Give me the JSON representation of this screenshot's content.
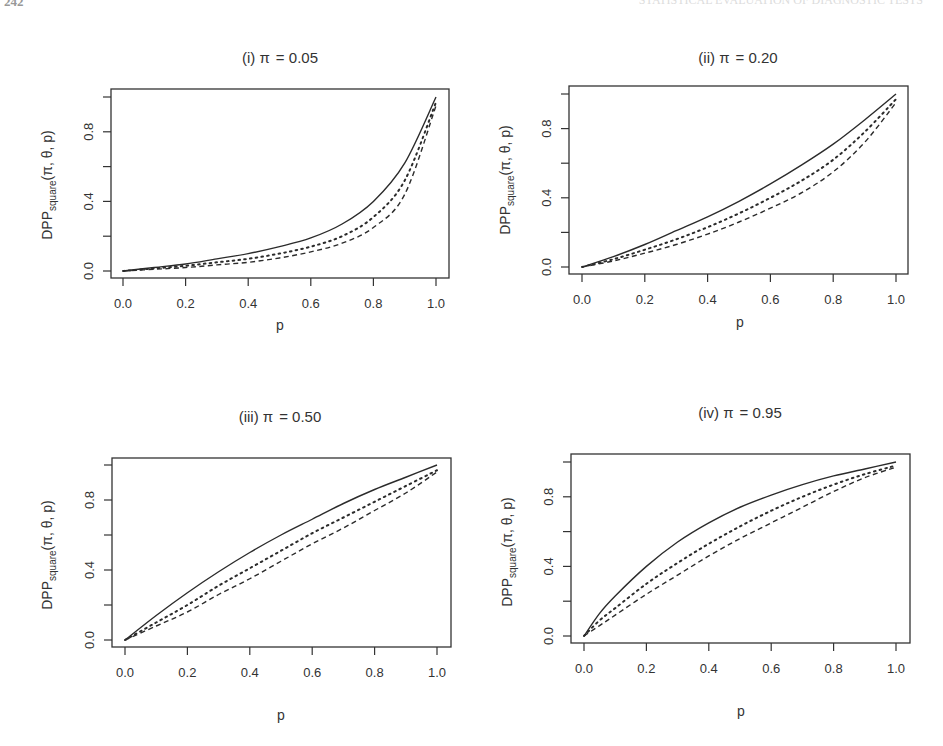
{
  "page": {
    "page_number": "242",
    "running_head": "STATISTICAL EVALUATION OF DIAGNOSTIC TESTS"
  },
  "chart_data": [
    {
      "type": "line",
      "panel": "i",
      "title": "(i) π = 0.05",
      "title_prefix": "(i) π",
      "title_value": "= 0.05",
      "pi": 0.05,
      "xlabel": "p",
      "ylabel": "DPP_square(π, θ, p)",
      "xlim": [
        0,
        1
      ],
      "ylim": [
        0,
        1
      ],
      "xticks": [
        0.0,
        0.2,
        0.4,
        0.6,
        0.8,
        1.0
      ],
      "xtick_labels": [
        "0.0",
        "0.2",
        "0.4",
        "0.6",
        "0.8",
        "1.0"
      ],
      "yticks": [
        0.0,
        0.2,
        0.4,
        0.6,
        0.8,
        1.0
      ],
      "ytick_labels": [
        "0.0",
        "",
        "0.4",
        "",
        "0.8",
        ""
      ],
      "grid": false,
      "legend": null,
      "x": [
        0,
        0.1,
        0.2,
        0.3,
        0.4,
        0.5,
        0.6,
        0.7,
        0.8,
        0.9,
        1.0
      ],
      "series": [
        {
          "name": "solid",
          "style": "solid",
          "values": [
            0,
            0.02,
            0.04,
            0.07,
            0.1,
            0.14,
            0.19,
            0.27,
            0.4,
            0.62,
            1.0
          ]
        },
        {
          "name": "dotted",
          "style": "dotted",
          "values": [
            0,
            0.015,
            0.03,
            0.05,
            0.07,
            0.1,
            0.14,
            0.2,
            0.31,
            0.52,
            0.97
          ]
        },
        {
          "name": "dashed",
          "style": "dashed",
          "values": [
            0,
            0.01,
            0.02,
            0.035,
            0.05,
            0.075,
            0.11,
            0.16,
            0.25,
            0.44,
            0.95
          ]
        }
      ]
    },
    {
      "type": "line",
      "panel": "ii",
      "title": "(ii) π = 0.20",
      "title_prefix": "(ii) π",
      "title_value": "= 0.20",
      "pi": 0.2,
      "xlabel": "p",
      "ylabel": "DPP_square(π, θ, p)",
      "xlim": [
        0,
        1
      ],
      "ylim": [
        0,
        1
      ],
      "xticks": [
        0.0,
        0.2,
        0.4,
        0.6,
        0.8,
        1.0
      ],
      "xtick_labels": [
        "0.0",
        "0.2",
        "0.4",
        "0.6",
        "0.8",
        "1.0"
      ],
      "yticks": [
        0.0,
        0.2,
        0.4,
        0.6,
        0.8,
        1.0
      ],
      "ytick_labels": [
        "0.0",
        "",
        "0.4",
        "",
        "0.8",
        ""
      ],
      "grid": false,
      "legend": null,
      "x": [
        0,
        0.1,
        0.2,
        0.3,
        0.4,
        0.5,
        0.6,
        0.7,
        0.8,
        0.9,
        1.0
      ],
      "series": [
        {
          "name": "solid",
          "style": "solid",
          "values": [
            0,
            0.06,
            0.13,
            0.21,
            0.29,
            0.38,
            0.48,
            0.59,
            0.71,
            0.85,
            1.0
          ]
        },
        {
          "name": "dotted",
          "style": "dotted",
          "values": [
            0,
            0.045,
            0.1,
            0.16,
            0.23,
            0.31,
            0.4,
            0.5,
            0.62,
            0.78,
            0.97
          ]
        },
        {
          "name": "dashed",
          "style": "dashed",
          "values": [
            0,
            0.035,
            0.08,
            0.13,
            0.19,
            0.26,
            0.34,
            0.43,
            0.55,
            0.72,
            0.95
          ]
        }
      ]
    },
    {
      "type": "line",
      "panel": "iii",
      "title": "(iii) π = 0.50",
      "title_prefix": "(iii) π",
      "title_value": "= 0.50",
      "pi": 0.5,
      "xlabel": "p",
      "ylabel": "DPP_square(π, θ, p)",
      "xlim": [
        0,
        1
      ],
      "ylim": [
        0,
        1
      ],
      "xticks": [
        0.0,
        0.2,
        0.4,
        0.6,
        0.8,
        1.0
      ],
      "xtick_labels": [
        "0.0",
        "0.2",
        "0.4",
        "0.6",
        "0.8",
        "1.0"
      ],
      "yticks": [
        0.0,
        0.2,
        0.4,
        0.6,
        0.8,
        1.0
      ],
      "ytick_labels": [
        "0.0",
        "",
        "0.4",
        "",
        "0.8",
        ""
      ],
      "grid": false,
      "legend": null,
      "x": [
        0,
        0.1,
        0.2,
        0.3,
        0.4,
        0.5,
        0.6,
        0.7,
        0.8,
        0.9,
        1.0
      ],
      "series": [
        {
          "name": "solid",
          "style": "solid",
          "values": [
            0,
            0.14,
            0.27,
            0.39,
            0.5,
            0.6,
            0.69,
            0.78,
            0.86,
            0.93,
            1.0
          ]
        },
        {
          "name": "dotted",
          "style": "dotted",
          "values": [
            0,
            0.1,
            0.2,
            0.31,
            0.41,
            0.51,
            0.61,
            0.7,
            0.79,
            0.88,
            0.97
          ]
        },
        {
          "name": "dashed",
          "style": "dashed",
          "values": [
            0,
            0.08,
            0.16,
            0.26,
            0.35,
            0.45,
            0.55,
            0.64,
            0.74,
            0.84,
            0.96
          ]
        }
      ]
    },
    {
      "type": "line",
      "panel": "iv",
      "title": "(iv) π = 0.95",
      "title_prefix": "(iv) π",
      "title_value": "= 0.95",
      "pi": 0.95,
      "xlabel": "p",
      "ylabel": "DPP_square(π, θ, p)",
      "xlim": [
        0,
        1
      ],
      "ylim": [
        0,
        1
      ],
      "xticks": [
        0.0,
        0.2,
        0.4,
        0.6,
        0.8,
        1.0
      ],
      "xtick_labels": [
        "0.0",
        "0.2",
        "0.4",
        "0.6",
        "0.8",
        "1.0"
      ],
      "yticks": [
        0.0,
        0.2,
        0.4,
        0.6,
        0.8,
        1.0
      ],
      "ytick_labels": [
        "0.0",
        "",
        "0.4",
        "",
        "0.8",
        ""
      ],
      "grid": false,
      "legend": null,
      "x": [
        0,
        0.05,
        0.1,
        0.2,
        0.3,
        0.4,
        0.5,
        0.6,
        0.7,
        0.8,
        0.9,
        1.0
      ],
      "series": [
        {
          "name": "solid",
          "style": "solid",
          "values": [
            0,
            0.13,
            0.23,
            0.4,
            0.54,
            0.65,
            0.74,
            0.81,
            0.87,
            0.92,
            0.96,
            1.0
          ]
        },
        {
          "name": "dotted",
          "style": "dotted",
          "values": [
            0,
            0.09,
            0.16,
            0.3,
            0.42,
            0.53,
            0.63,
            0.72,
            0.8,
            0.87,
            0.93,
            0.98
          ]
        },
        {
          "name": "dashed",
          "style": "dashed",
          "values": [
            0,
            0.06,
            0.12,
            0.24,
            0.35,
            0.46,
            0.56,
            0.65,
            0.74,
            0.83,
            0.91,
            0.97
          ]
        }
      ]
    }
  ],
  "panels": [
    {
      "title_prefix": "(i) π",
      "title_value": "= 0.05"
    },
    {
      "title_prefix": "(ii) π",
      "title_value": "= 0.20"
    },
    {
      "title_prefix": "(iii) π",
      "title_value": "= 0.50"
    },
    {
      "title_prefix": "(iv) π",
      "title_value": "= 0.95"
    }
  ],
  "axis": {
    "xlabel": "p",
    "ylabel_main": "DPP",
    "ylabel_sub": "square",
    "ylabel_args": "(π, θ, p)"
  },
  "colors": {
    "line": "#2b2b2b",
    "axis": "#333333",
    "text": "#333333",
    "background": "#ffffff"
  }
}
